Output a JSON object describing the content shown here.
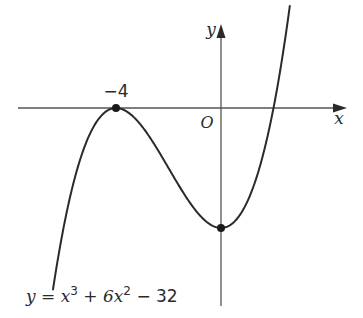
{
  "figure": {
    "axis_x_label": "x",
    "axis_y_label": "y",
    "origin_label": "O",
    "local_max_label": "−4",
    "equation": {
      "lhs": "y = x",
      "exp1": "3",
      "mid": " + 6x",
      "exp2": "2",
      "rhs": " − 32"
    }
  },
  "chart_data": {
    "type": "line",
    "title": "",
    "function": "y = x^3 + 6x^2 - 32",
    "xlabel": "x",
    "ylabel": "y",
    "marked_points": [
      {
        "x": -4,
        "y": 0,
        "label": "-4",
        "note": "local maximum, touches x-axis"
      },
      {
        "x": 0,
        "y": -32,
        "label": "",
        "note": "local minimum on y-axis"
      }
    ],
    "x_intercepts": [
      -4,
      2
    ],
    "y_intercept": -32,
    "xlim": [
      -7,
      4.8
    ],
    "ylim": [
      -52,
      22
    ],
    "grid": false
  },
  "colors": {
    "curve": "#2a2a2a",
    "axis": "#555555",
    "background": "#ffffff"
  }
}
